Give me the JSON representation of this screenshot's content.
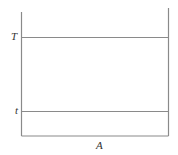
{
  "diagram": {
    "labels": {
      "upper": "T",
      "lower": "t",
      "bottom": "A"
    },
    "line_color": "#8a8a8a"
  }
}
